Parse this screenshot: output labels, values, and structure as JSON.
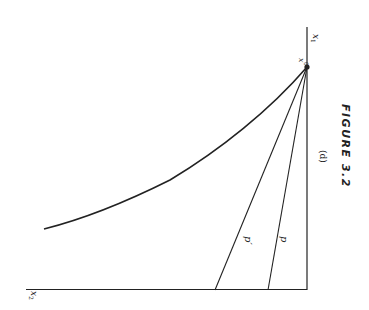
{
  "figure": {
    "caption": "FIGURE 3.2",
    "panel_label": "(d)",
    "axes": {
      "vertical_axis_label": "x",
      "vertical_axis_subscript": "1",
      "horizontal_axis_label": "x",
      "horizontal_axis_subscript": "2"
    },
    "point": {
      "label": "x",
      "superscript": "0"
    },
    "lines": [
      {
        "id": "p_prime",
        "label": "p′"
      },
      {
        "id": "p",
        "label": "p"
      }
    ],
    "colors": {
      "ink": "#222222",
      "background": "#ffffff"
    }
  }
}
